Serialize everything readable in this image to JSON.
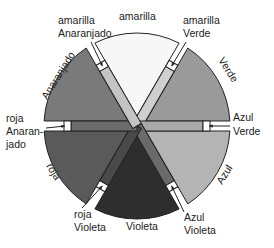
{
  "center": {
    "x": 137,
    "y": 126
  },
  "radius": 93,
  "strip": {
    "length": 66,
    "half_width": 5,
    "tip": 7
  },
  "sectors": [
    {
      "name": "amarilla",
      "label": "amarilla",
      "angle": -90,
      "color": "#f7f7f7"
    },
    {
      "name": "verde",
      "label": "Verde",
      "angle": -30,
      "color": "#9a9a9a"
    },
    {
      "name": "azul",
      "label": "Azul",
      "angle": 30,
      "color": "#b4b4b4"
    },
    {
      "name": "violeta",
      "label": "Violeta",
      "angle": 90,
      "color": "#2e2e2e"
    },
    {
      "name": "roja",
      "label": "roja",
      "angle": 150,
      "color": "#5a5a5a"
    },
    {
      "name": "anaranjado",
      "label": "Anaranjado",
      "angle": 210,
      "color": "#7a7a7a"
    }
  ],
  "strips": [
    {
      "name": "amarilla-verde",
      "label": [
        "amarilla",
        "Verde"
      ],
      "angle": -60,
      "color": "#cfcfcf"
    },
    {
      "name": "azul-verde",
      "label": [
        "Azul",
        "Verde"
      ],
      "angle": 0,
      "color": "#a8a8a8"
    },
    {
      "name": "azul-violeta",
      "label": [
        "Azul",
        "Violeta"
      ],
      "angle": 60,
      "color": "#6a6a6a"
    },
    {
      "name": "roja-violeta",
      "label": [
        "roja",
        "Violeta"
      ],
      "angle": 120,
      "color": "#4a4a4a"
    },
    {
      "name": "roja-anaranjado",
      "label": [
        "roja",
        "Anaran-",
        "jado"
      ],
      "angle": 180,
      "color": "#6c6c6c"
    },
    {
      "name": "amarilla-anaranjado",
      "label": [
        "amarilla",
        "Anaranjado"
      ],
      "angle": 240,
      "color": "#c4c4c4"
    }
  ],
  "text": {
    "amarilla_top": "amarilla",
    "am_verde_1": "amarilla",
    "am_verde_2": "Verde",
    "am_anar_1": "amarilla",
    "am_anar_2": "Anaranjado",
    "verde": "Verde",
    "azul_verde_1": "Azul",
    "azul_verde_2": "Verde",
    "azul": "Azul",
    "azul_vio_1": "Azul",
    "azul_vio_2": "Violeta",
    "violeta": "Violeta",
    "roja_vio_1": "roja",
    "roja_vio_2": "Violeta",
    "roja": "roja",
    "roja_anar_1": "roja",
    "roja_anar_2": "Anaran-",
    "roja_anar_3": "jado",
    "anaranjado": "Anaranjado"
  }
}
